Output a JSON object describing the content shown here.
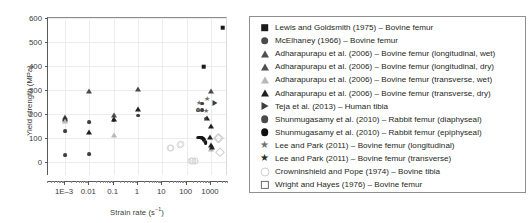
{
  "chart_data": {
    "type": "scatter",
    "title": "",
    "xlabel": "Strain rate (s⁻¹)",
    "xlabel_base": "Strain rate (s",
    "xlabel_sup": "−1",
    "xlabel_tail": ")",
    "ylabel": "Yield strength (MPa)",
    "xscale": "log",
    "xlim": [
      0.0002,
      5000
    ],
    "ylim": [
      -60,
      600
    ],
    "grid": true,
    "legend_position": "right-outside",
    "xticks": [
      {
        "value": 0.001,
        "label": "1E–3"
      },
      {
        "value": 0.01,
        "label": "0.01"
      },
      {
        "value": 0.1,
        "label": "0.1"
      },
      {
        "value": 1,
        "label": "1"
      },
      {
        "value": 10,
        "label": "10"
      },
      {
        "value": 100,
        "label": "100"
      },
      {
        "value": 1000,
        "label": "1000"
      }
    ],
    "yticks": [
      {
        "value": 0,
        "label": "0"
      },
      {
        "value": 100,
        "label": "100"
      },
      {
        "value": 200,
        "label": "200"
      },
      {
        "value": 300,
        "label": "300"
      },
      {
        "value": 400,
        "label": "400"
      },
      {
        "value": 500,
        "label": "500"
      },
      {
        "value": 600,
        "label": "600"
      }
    ],
    "series": [
      {
        "name": "Lewis and Goldsmith (1975) – Bovine femur",
        "marker": "square",
        "marker_class": "m-square",
        "size": 4.6,
        "points": [
          [
            500,
            396
          ],
          [
            3000,
            560
          ]
        ]
      },
      {
        "name": "McElhaney (1966) – Bovine femur",
        "marker": "circle",
        "marker_class": "m-circle",
        "size": 3.8,
        "points": [
          [
            0.001,
            172
          ],
          [
            0.001,
            126
          ],
          [
            0.001,
            28
          ],
          [
            0.01,
            164
          ],
          [
            0.01,
            30
          ],
          [
            0.1,
            174
          ],
          [
            1,
            192
          ]
        ]
      },
      {
        "name": "Adharapurapu et al. (2006) – Bovine femur (longitudinal, wet)",
        "marker": "triangle",
        "marker_class": "m-tri",
        "size": 4.2,
        "points": [
          [
            0.001,
            188
          ],
          [
            0.01,
            293
          ],
          [
            0.1,
            196
          ],
          [
            1,
            305
          ],
          [
            1000,
            295
          ]
        ]
      },
      {
        "name": "Adharapurapu et al. (2006) – Bovine femur (longitudinal, dry)",
        "marker": "triangle",
        "marker_class": "m-tri-dark",
        "size": 4.2,
        "points": [
          [
            0.001,
            178
          ],
          [
            0.01,
            124
          ],
          [
            0.1,
            178
          ],
          [
            1,
            218
          ],
          [
            1000,
            148
          ]
        ]
      },
      {
        "name": "Adharapurapu et al. (2006) – Bovine femur (transverse, wet)",
        "marker": "triangle",
        "marker_class": "m-tri-grey",
        "size": 4.2,
        "points": [
          [
            0.001,
            170
          ],
          [
            0.1,
            112
          ],
          [
            1000,
            52
          ]
        ]
      },
      {
        "name": "Adharapurapu et al. (2006) – Bovine femur (transverse, dry)",
        "marker": "triangle",
        "marker_class": "m-tri-dark",
        "size": 4.2,
        "points": [
          [
            700,
            182
          ],
          [
            900,
            104
          ],
          [
            1000,
            68
          ],
          [
            1100,
            60
          ]
        ]
      },
      {
        "name": "Teja et al. (2013) – Human tibia",
        "marker": "triangle-right",
        "marker_class": "m-tri-right",
        "size": 4.2,
        "points": [
          [
            1500,
            247
          ]
        ]
      },
      {
        "name": "Shunmugasamy et al. (2010) – Rabbit femur (diaphyseal)",
        "marker": "circle",
        "marker_class": "m-circle",
        "size": 3.8,
        "points": [
          [
            300,
            216
          ],
          [
            420,
            242
          ],
          [
            420,
            214
          ],
          [
            600,
            180
          ],
          [
            300,
            100
          ],
          [
            340,
            100
          ],
          [
            380,
            100
          ],
          [
            430,
            99
          ],
          [
            470,
            96
          ],
          [
            520,
            90
          ],
          [
            560,
            84
          ]
        ]
      },
      {
        "name": "Shunmugasamy et al. (2010) – Rabbit femur (epiphyseal)",
        "marker": "circle",
        "marker_class": "m-circle-dark",
        "size": 3.8,
        "points": [
          [
            320,
            100
          ],
          [
            400,
            100
          ],
          [
            500,
            95
          ],
          [
            600,
            78
          ]
        ]
      },
      {
        "name": "Lee and Park (2011) – Bovine femur (longitudinal)",
        "marker": "star",
        "marker_class": "m-star",
        "size": 7,
        "points": [
          [
            330,
            250
          ],
          [
            700,
            264
          ]
        ]
      },
      {
        "name": "Lee and Park (2011) – Bovine femur (transverse)",
        "marker": "star",
        "marker_class": "m-star",
        "size": 7,
        "points": [
          [
            300,
            218
          ],
          [
            620,
            216
          ]
        ]
      },
      {
        "name": "Crowninshield and Pope (1974) – Bovine tibia",
        "marker": "open-circle",
        "marker_class": "m-ocircle",
        "size": 5,
        "points": [
          [
            20,
            58
          ],
          [
            22,
            56
          ],
          [
            55,
            70
          ],
          [
            60,
            72
          ],
          [
            150,
            4
          ],
          [
            170,
            2
          ],
          [
            190,
            2
          ],
          [
            210,
            3
          ],
          [
            230,
            2
          ]
        ]
      },
      {
        "name": "Wright and Hayes (1976) – Bovine femur",
        "marker": "open-diamond",
        "marker_class": "m-odiamond",
        "size": 4.6,
        "points": [
          [
            2000,
            100
          ],
          [
            2200,
            98
          ],
          [
            2400,
            42
          ]
        ]
      }
    ]
  },
  "legend": {
    "items": [
      {
        "label": "Lewis and Goldsmith (1975) – Bovine femur",
        "glyph": "square",
        "glyph_class": "lg-square",
        "icon_name": "legend-marker-square-filled"
      },
      {
        "label": "McElhaney (1966) – Bovine femur",
        "glyph": "circle",
        "glyph_class": "lg-circle",
        "icon_name": "legend-marker-circle-filled"
      },
      {
        "label": "Adharapurapu et al. (2006) – Bovine femur (longitudinal, wet)",
        "glyph": "triangle",
        "glyph_class": "lg-tri",
        "icon_name": "legend-marker-triangle-grey"
      },
      {
        "label": "Adharapurapu et al. (2006) – Bovine femur (longitudinal, dry)",
        "glyph": "triangle",
        "glyph_class": "lg-tri",
        "icon_name": "legend-marker-triangle-grey"
      },
      {
        "label": "Adharapurapu et al. (2006) – Bovine femur (transverse, wet)",
        "glyph": "triangle",
        "glyph_class": "lg-tri-grey",
        "icon_name": "legend-marker-triangle-light"
      },
      {
        "label": "Adharapurapu et al. (2006) – Bovine femur (transverse, dry)",
        "glyph": "triangle",
        "glyph_class": "lg-tri-dark",
        "icon_name": "legend-marker-triangle-dark"
      },
      {
        "label": "Teja et al. (2013) – Human tibia",
        "glyph": "triangle-right",
        "glyph_class": "lg-tri-right",
        "icon_name": "legend-marker-triangle-right"
      },
      {
        "label": "Shunmugasamy et al. (2010) – Rabbit femur (diaphyseal)",
        "glyph": "circle",
        "glyph_class": "lg-circle",
        "icon_name": "legend-marker-circle-grey"
      },
      {
        "label": "Shunmugasamy et al. (2010) – Rabbit femur (epiphyseal)",
        "glyph": "circle",
        "glyph_class": "lg-circle-dark",
        "icon_name": "legend-marker-circle-dark"
      },
      {
        "label": "Lee and Park (2011) – Bovine femur (longitudinal)",
        "glyph": "★",
        "glyph_class": "lg-star",
        "icon_name": "legend-marker-star-light"
      },
      {
        "label": "Lee and Park (2011) – Bovine femur (transverse)",
        "glyph": "★",
        "glyph_class": "lg-star-dark",
        "icon_name": "legend-marker-star-dark"
      },
      {
        "label": "Crowninshield and Pope (1974) – Bovine tibia",
        "glyph": "open-circle",
        "glyph_class": "lg-ocircle",
        "icon_name": "legend-marker-open-circle"
      },
      {
        "label": "Wright and Hayes (1976) – Bovine femur",
        "glyph": "open-diamond",
        "glyph_class": "lg-odiamond",
        "icon_name": "legend-marker-open-diamond"
      }
    ]
  },
  "colors": {
    "axis": "#58595b",
    "grid": "#ececec",
    "text": "#231f20",
    "tick_text": "#3b3b3b",
    "legend_border": "#8e9092",
    "marker_dark": "#1a1a1a",
    "marker_grey": "#4a4a4a",
    "marker_light": "#b6b8ba",
    "background": "#ffffff"
  }
}
